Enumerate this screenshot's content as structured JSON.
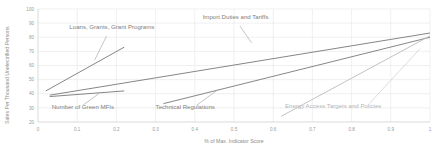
{
  "chart_data": {
    "type": "line",
    "title": "",
    "subtitle": "",
    "xlabel": "% of Max. Indicator Score",
    "ylabel": "Sales Per Thousand Unelectrified Persons",
    "xlim": [
      0,
      1
    ],
    "ylim": [
      20,
      100
    ],
    "grid": true,
    "grid_axis": "both",
    "legend_position": "inline-annotations",
    "xticks": [
      "0",
      "0.1",
      "0.2",
      "0.3",
      "0.4",
      "0.5",
      "0.6",
      "0.7",
      "0.8",
      "0.9",
      "1"
    ],
    "xtick_values": [
      0,
      0.1,
      0.2,
      0.3,
      0.4,
      0.5,
      0.6,
      0.7,
      0.8,
      0.9,
      1
    ],
    "yticks": [
      "20",
      "30",
      "40",
      "50",
      "60",
      "70",
      "80",
      "90",
      "100"
    ],
    "ytick_values": [
      20,
      30,
      40,
      50,
      60,
      70,
      80,
      90,
      100
    ],
    "series": [
      {
        "name": "Loans, Grants, Grant Programs",
        "color": "#7f7f7f",
        "x": [
          0.02,
          0.22
        ],
        "values": [
          42,
          73
        ],
        "label_x": 0.08,
        "label_y": 86,
        "label_align": "start",
        "label_faint": false
      },
      {
        "name": "Import Duties and Tariffs",
        "color": "#7f7f7f",
        "x": [
          0.03,
          1.0
        ],
        "values": [
          39,
          83
        ],
        "label_x": 0.42,
        "label_y": 93,
        "label_align": "start",
        "label_faint": false
      },
      {
        "name": "Number of Green MFIs",
        "color": "#7f7f7f",
        "x": [
          0.03,
          0.22
        ],
        "values": [
          38,
          42
        ],
        "label_x": 0.035,
        "label_y": 29,
        "label_align": "start",
        "label_faint": false
      },
      {
        "name": "Technical Regulations",
        "color": "#7f7f7f",
        "x": [
          0.32,
          1.0
        ],
        "values": [
          33,
          80
        ],
        "label_x": 0.3,
        "label_y": 29,
        "label_align": "start",
        "label_faint": false
      },
      {
        "name": "Energy Access Targets and Policies",
        "color": "#bfbfbf",
        "x": [
          0.62,
          1.0
        ],
        "values": [
          24,
          81
        ],
        "label_x": 0.63,
        "label_y": 30,
        "label_align": "start",
        "label_faint": true
      }
    ]
  },
  "axes": {
    "y_title": "Sales Per Thousand Unelectrified Persons",
    "x_title": "% of Max. Indicator Score"
  },
  "colors": {
    "line_dark": "#7f7f7f",
    "line_light": "#bfbfbf",
    "grid": "#e6e6e6",
    "tick_text": "#9a9a9a",
    "label_text": "#808080",
    "label_text_faint": "#b5b5b5",
    "background": "#ffffff"
  }
}
